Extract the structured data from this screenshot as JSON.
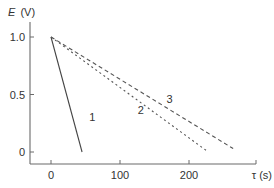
{
  "chart_data": {
    "type": "line",
    "title": "",
    "xlabel": "τ (s)",
    "ylabel": "E (V)",
    "ylabel_symbol": "E",
    "ylabel_unit": "(V)",
    "xlim": [
      -30,
      300
    ],
    "ylim": [
      -0.1,
      1.1
    ],
    "xticks": [
      0,
      100,
      200
    ],
    "xtick_labels": [
      "0",
      "100",
      "200"
    ],
    "yticks": [
      0,
      0.5,
      1.0
    ],
    "ytick_labels": [
      "0",
      "0.5",
      "1.0"
    ],
    "grid": false,
    "legend": "none",
    "series": [
      {
        "name": "1",
        "style": "solid",
        "x": [
          0,
          45
        ],
        "y": [
          1.0,
          0.0
        ],
        "label_at": [
          60,
          0.27
        ]
      },
      {
        "name": "2",
        "style": "dotted",
        "x": [
          0,
          228
        ],
        "y": [
          1.0,
          0.0
        ],
        "label_at": [
          130,
          0.33
        ]
      },
      {
        "name": "3",
        "style": "dashed",
        "x": [
          0,
          264
        ],
        "y": [
          1.0,
          0.03
        ],
        "label_at": [
          172,
          0.43
        ]
      }
    ]
  }
}
